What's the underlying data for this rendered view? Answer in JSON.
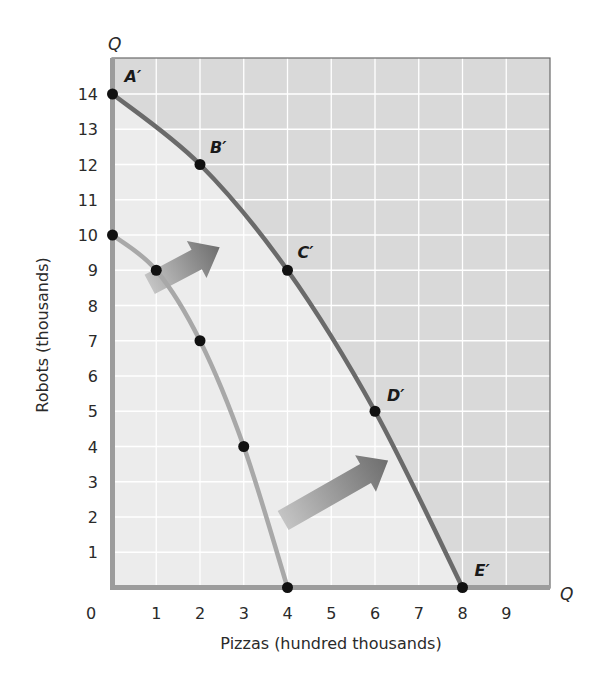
{
  "chart_data": {
    "type": "line",
    "title": "",
    "xlabel": "Pizzas (hundred thousands)",
    "ylabel": "Robots (thousands)",
    "x_axis_end_label": "Q",
    "y_axis_end_label": "Q",
    "xlim": [
      0,
      10
    ],
    "ylim": [
      0,
      15
    ],
    "x_ticks": [
      "0",
      "1",
      "2",
      "3",
      "4",
      "5",
      "6",
      "7",
      "8",
      "9"
    ],
    "y_ticks": [
      "1",
      "2",
      "3",
      "4",
      "5",
      "6",
      "7",
      "8",
      "9",
      "10",
      "11",
      "12",
      "13",
      "14"
    ],
    "grid": true,
    "legend": null,
    "series": [
      {
        "name": "Original PPF",
        "color": "#a8a8a8",
        "points": [
          {
            "x": 0,
            "y": 10,
            "label": ""
          },
          {
            "x": 1,
            "y": 9,
            "label": ""
          },
          {
            "x": 2,
            "y": 7,
            "label": ""
          },
          {
            "x": 3,
            "y": 4,
            "label": ""
          },
          {
            "x": 4,
            "y": 0,
            "label": ""
          }
        ]
      },
      {
        "name": "Expanded PPF",
        "color": "#6a6a6a",
        "points": [
          {
            "x": 0,
            "y": 14,
            "label": "A′"
          },
          {
            "x": 2,
            "y": 12,
            "label": "B′"
          },
          {
            "x": 4,
            "y": 9,
            "label": "C′"
          },
          {
            "x": 6,
            "y": 5,
            "label": "D′"
          },
          {
            "x": 8,
            "y": 0,
            "label": "E′"
          }
        ]
      }
    ],
    "annotations": [
      {
        "type": "arrow",
        "from": [
          0.85,
          8.6
        ],
        "to": [
          2.45,
          9.65
        ],
        "meaning": "outward shift of PPF"
      },
      {
        "type": "arrow",
        "from": [
          3.9,
          1.9
        ],
        "to": [
          6.3,
          3.6
        ],
        "meaning": "outward shift of PPF"
      }
    ],
    "colors": {
      "outer_region": "#d9d9d9",
      "inner_region": "#ececec",
      "grid": "#ffffff",
      "axis": "#9c9c9c",
      "point": "#111111"
    }
  }
}
